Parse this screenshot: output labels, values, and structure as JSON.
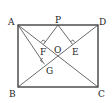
{
  "diagram": {
    "type": "geometry",
    "points": {
      "A": {
        "label": "A",
        "x": 18,
        "y": 25
      },
      "B": {
        "label": "B",
        "x": 18,
        "y": 87
      },
      "C": {
        "label": "C",
        "x": 98,
        "y": 87
      },
      "D": {
        "label": "D",
        "x": 98,
        "y": 25
      },
      "P": {
        "label": "P",
        "x": 58,
        "y": 25
      },
      "O": {
        "label": "O",
        "x": 58,
        "y": 56
      },
      "F": {
        "label": "F",
        "x": 43,
        "y": 45
      },
      "E": {
        "label": "E",
        "x": 73,
        "y": 45
      },
      "G": {
        "label": "G",
        "x": 44,
        "y": 64
      }
    },
    "segments": [
      "AB",
      "BC",
      "CD",
      "DA",
      "AC",
      "BD",
      "PF",
      "PE",
      "AG"
    ],
    "right_angles": [
      "PF⊥AC at F",
      "PE⊥BD at E",
      "AG⊥BD at G"
    ],
    "colors": {
      "stroke": "#333333",
      "background": "#ffffff"
    }
  }
}
